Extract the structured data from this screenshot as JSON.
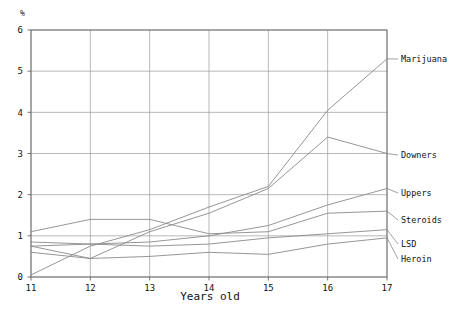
{
  "chart_data": {
    "type": "line",
    "title": "",
    "xlabel": "Years old",
    "ylabel": "%",
    "x": [
      11,
      12,
      13,
      14,
      15,
      16,
      17
    ],
    "xlim": [
      11,
      17
    ],
    "ylim": [
      0,
      6
    ],
    "xticks": [
      "11",
      "12",
      "13",
      "14",
      "15",
      "16",
      "17"
    ],
    "yticks": [
      "0",
      "1",
      "2",
      "3",
      "4",
      "5",
      "6"
    ],
    "grid": true,
    "legend_position": "right-inline-labels",
    "series": [
      {
        "name": "Marijuana",
        "values": [
          0.05,
          0.75,
          1.15,
          1.7,
          2.2,
          4.05,
          5.3
        ]
      },
      {
        "name": "Downers",
        "values": [
          0.6,
          0.45,
          1.1,
          1.55,
          2.15,
          3.4,
          3.0
        ]
      },
      {
        "name": "Uppers",
        "values": [
          0.75,
          0.8,
          0.85,
          1.0,
          1.25,
          1.75,
          2.15
        ]
      },
      {
        "name": "Steroids",
        "values": [
          1.1,
          1.4,
          1.4,
          1.05,
          1.1,
          1.55,
          1.6
        ]
      },
      {
        "name": "LSD",
        "values": [
          0.85,
          0.8,
          0.75,
          0.8,
          0.95,
          1.05,
          1.15
        ]
      },
      {
        "name": "Heroin",
        "values": [
          0.75,
          0.45,
          0.5,
          0.6,
          0.55,
          0.8,
          0.95
        ]
      }
    ]
  },
  "axis": {
    "y_unit": "%",
    "x_title": "Years old"
  },
  "colors": {
    "line": "#8a8a8a",
    "grid": "#9a9a9a",
    "axis": "#666666",
    "text": "#111111",
    "background": "#ffffff"
  }
}
